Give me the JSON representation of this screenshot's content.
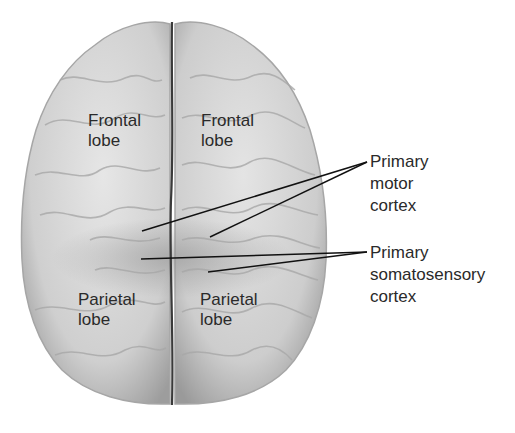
{
  "figure": {
    "colors": {
      "background": "#ffffff",
      "brain_fill": "#d4d4d4",
      "brain_shadow": "#9a9a9a",
      "midline": "#3a3a3a",
      "text": "#2a2a2a",
      "leader_line": "#111111"
    }
  },
  "region_labels": [
    {
      "id": "frontal-left",
      "line1": "Frontal",
      "line2": "lobe"
    },
    {
      "id": "frontal-right",
      "line1": "Frontal",
      "line2": "lobe"
    },
    {
      "id": "parietal-left",
      "line1": "Parietal",
      "line2": "lobe"
    },
    {
      "id": "parietal-right",
      "line1": "Parietal",
      "line2": "lobe"
    }
  ],
  "callouts": [
    {
      "id": "primary-motor-cortex",
      "lines": [
        "Primary",
        "motor",
        "cortex"
      ]
    },
    {
      "id": "primary-somatosensory-cortex",
      "lines": [
        "Primary",
        "somatosensory",
        "cortex"
      ]
    }
  ]
}
